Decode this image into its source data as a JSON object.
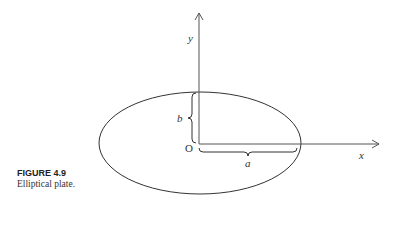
{
  "figure": {
    "caption_title": "FIGURE 4.9",
    "caption_text": "Elliptical plate."
  },
  "diagram": {
    "shape": "ellipse",
    "axis_labels": {
      "x": "x",
      "y": "y"
    },
    "origin_label": "O",
    "semi_axis_labels": {
      "horizontal": "a",
      "vertical": "b"
    }
  }
}
